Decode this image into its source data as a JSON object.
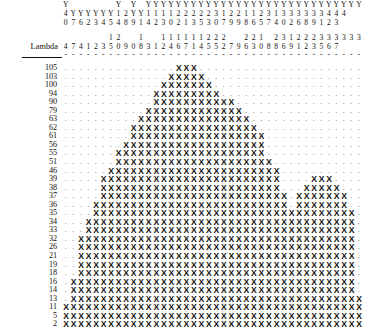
{
  "axis": {
    "row_label_header": "Lambda",
    "x_marker": "X",
    "empty_marker": ".",
    "rule_marker": "-"
  },
  "chart_data": {
    "type": "heatmap",
    "title": "",
    "subtitle": "",
    "xlabel": "",
    "ylabel": "Lambda",
    "grid": false,
    "legend": null,
    "column_header_rows": [
      [
        "Y",
        "",
        "",
        "",
        "",
        "",
        "",
        "Y",
        "",
        "Y",
        "",
        "Y",
        "Y",
        "Y",
        "Y",
        "Y",
        "Y",
        "Y",
        "Y",
        "Y",
        "Y",
        "Y",
        "Y",
        "Y",
        "Y",
        "Y",
        "Y",
        "Y",
        "Y",
        "Y",
        "Y",
        "Y",
        "Y",
        "Y",
        "Y",
        "Y",
        "Y",
        "Y",
        "Y",
        "Y"
      ],
      [
        "4",
        "Y",
        "Y",
        "Y",
        "Y",
        "Y",
        "Y",
        "1",
        "2",
        "Y",
        "Y",
        "1",
        "1",
        "1",
        "1",
        "2",
        "2",
        "2",
        "2",
        "2",
        "3",
        "1",
        "2",
        "2",
        "1",
        "1",
        "2",
        "3",
        "1",
        "3",
        "3",
        "3",
        "3",
        "3",
        "3",
        "4",
        "4",
        "4",
        "",
        ""
      ],
      [
        "0",
        "7",
        "6",
        "2",
        "3",
        "4",
        "5",
        "4",
        "8",
        "9",
        "1",
        "4",
        "2",
        "3",
        "0",
        "2",
        "1",
        "3",
        "5",
        "3",
        "0",
        "7",
        "9",
        "9",
        "8",
        "6",
        "5",
        "7",
        "4",
        "0",
        "2",
        "6",
        "8",
        "9",
        "1",
        "2",
        "3",
        "",
        "",
        ""
      ]
    ],
    "column_index_rows": [
      [
        "",
        "",
        "",
        "",
        "",
        "",
        "1",
        "2",
        "",
        "",
        "1",
        "",
        "",
        "1",
        "1",
        "1",
        "1",
        "1",
        "1",
        "2",
        "2",
        "2",
        "",
        "",
        "2",
        "2",
        "1",
        "",
        "2",
        "3",
        "1",
        "2",
        "2",
        "2",
        "3",
        "3",
        "3",
        "3",
        "3",
        "3"
      ],
      [
        "4",
        "7",
        "4",
        "1",
        "2",
        "3",
        "5",
        "0",
        "9",
        "0",
        "8",
        "3",
        "1",
        "2",
        "4",
        "6",
        "7",
        "1",
        "4",
        "5",
        "5",
        "2",
        "7",
        "9",
        "6",
        "3",
        "0",
        "8",
        "8",
        "6",
        "9",
        "1",
        "2",
        "3",
        "5",
        "6",
        "7",
        "",
        "",
        ""
      ]
    ],
    "categories": [
      "105",
      "103",
      "100",
      "94",
      "90",
      "79",
      "63",
      "62",
      "61",
      "56",
      "55",
      "51",
      "46",
      "39",
      "38",
      "37",
      "36",
      "35",
      "34",
      "33",
      "32",
      "26",
      "21",
      "19",
      "18",
      "16",
      "14",
      "13",
      "11",
      "5",
      "2"
    ],
    "ylim": [
      2,
      105
    ],
    "n_columns": 40,
    "rows": [
      {
        "label": "105",
        "runs": [
          [
            15,
            17
          ]
        ]
      },
      {
        "label": "103",
        "runs": [
          [
            14,
            18
          ]
        ]
      },
      {
        "label": "100",
        "runs": [
          [
            13,
            19
          ]
        ]
      },
      {
        "label": "94",
        "runs": [
          [
            12,
            20
          ]
        ]
      },
      {
        "label": "90",
        "runs": [
          [
            12,
            22
          ]
        ]
      },
      {
        "label": "79",
        "runs": [
          [
            11,
            23
          ]
        ]
      },
      {
        "label": "63",
        "runs": [
          [
            10,
            24
          ]
        ]
      },
      {
        "label": "62",
        "runs": [
          [
            9,
            25
          ]
        ]
      },
      {
        "label": "61",
        "runs": [
          [
            9,
            26
          ]
        ]
      },
      {
        "label": "56",
        "runs": [
          [
            8,
            26
          ]
        ]
      },
      {
        "label": "55",
        "runs": [
          [
            7,
            26
          ]
        ]
      },
      {
        "label": "51",
        "runs": [
          [
            7,
            27
          ]
        ]
      },
      {
        "label": "46",
        "runs": [
          [
            6,
            28
          ]
        ]
      },
      {
        "label": "39",
        "runs": [
          [
            5,
            28
          ],
          [
            33,
            35
          ]
        ]
      },
      {
        "label": "38",
        "runs": [
          [
            5,
            28
          ],
          [
            32,
            36
          ]
        ]
      },
      {
        "label": "37",
        "runs": [
          [
            5,
            29
          ],
          [
            31,
            37
          ]
        ]
      },
      {
        "label": "36",
        "runs": [
          [
            4,
            29
          ],
          [
            31,
            37
          ]
        ]
      },
      {
        "label": "35",
        "runs": [
          [
            4,
            29
          ],
          [
            30,
            38
          ]
        ]
      },
      {
        "label": "34",
        "runs": [
          [
            3,
            29
          ],
          [
            29,
            38
          ]
        ]
      },
      {
        "label": "33",
        "runs": [
          [
            3,
            29
          ],
          [
            27,
            38
          ]
        ]
      },
      {
        "label": "32",
        "runs": [
          [
            2,
            29
          ],
          [
            26,
            38
          ]
        ]
      },
      {
        "label": "26",
        "runs": [
          [
            2,
            30
          ],
          [
            25,
            38
          ]
        ]
      },
      {
        "label": "21",
        "runs": [
          [
            2,
            31
          ],
          [
            23,
            38
          ]
        ]
      },
      {
        "label": "19",
        "runs": [
          [
            2,
            32
          ],
          [
            21,
            38
          ]
        ]
      },
      {
        "label": "18",
        "runs": [
          [
            2,
            33
          ],
          [
            19,
            38
          ]
        ]
      },
      {
        "label": "16",
        "runs": [
          [
            1,
            38
          ]
        ]
      },
      {
        "label": "14",
        "runs": [
          [
            1,
            38
          ]
        ]
      },
      {
        "label": "13",
        "runs": [
          [
            1,
            39
          ]
        ]
      },
      {
        "label": "11",
        "runs": [
          [
            0,
            39
          ]
        ]
      },
      {
        "label": "5",
        "runs": [
          [
            0,
            39
          ]
        ]
      },
      {
        "label": "2",
        "runs": [
          [
            0,
            39
          ]
        ]
      }
    ]
  }
}
